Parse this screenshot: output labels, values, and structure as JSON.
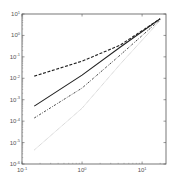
{
  "chart_data": {
    "type": "line",
    "title": "",
    "xlabel": "",
    "ylabel": "",
    "xscale": "log",
    "yscale": "log",
    "xlim": [
      0.1,
      25
    ],
    "ylim": [
      1e-06,
      10
    ],
    "grid": false,
    "legend": null,
    "x_ticks": [
      {
        "base": "10",
        "exp": "-1",
        "value": 0.1
      },
      {
        "base": "10",
        "exp": "0",
        "value": 1
      },
      {
        "base": "10",
        "exp": "1",
        "value": 10
      }
    ],
    "y_ticks": [
      {
        "base": "10",
        "exp": "1",
        "value": 10
      },
      {
        "base": "10",
        "exp": "0",
        "value": 1
      },
      {
        "base": "10",
        "exp": "-1",
        "value": 0.1
      },
      {
        "base": "10",
        "exp": "-2",
        "value": 0.01
      },
      {
        "base": "10",
        "exp": "-3",
        "value": 0.001
      },
      {
        "base": "10",
        "exp": "-4",
        "value": 0.0001
      },
      {
        "base": "10",
        "exp": "-5",
        "value": 1e-05
      },
      {
        "base": "10",
        "exp": "-6",
        "value": 1e-06
      }
    ],
    "series": [
      {
        "name": "dashed",
        "style": "dashed",
        "color": "#222222",
        "x": [
          0.16,
          1,
          4.3,
          20
        ],
        "y": [
          0.0126,
          0.063,
          0.35,
          6
        ]
      },
      {
        "name": "solid",
        "style": "solid",
        "color": "#222222",
        "x": [
          0.16,
          1,
          4.3,
          20
        ],
        "y": [
          0.0005,
          0.014,
          0.28,
          6
        ]
      },
      {
        "name": "dash-dot",
        "style": "dashdot",
        "color": "#333333",
        "x": [
          0.16,
          1,
          4.3,
          20
        ],
        "y": [
          0.00014,
          0.0035,
          0.12,
          5.5
        ]
      },
      {
        "name": "dotted",
        "style": "dotted",
        "color": "#999999",
        "x": [
          0.16,
          1,
          4.3,
          20
        ],
        "y": [
          4.5e-06,
          0.0004,
          0.045,
          5
        ]
      }
    ]
  }
}
